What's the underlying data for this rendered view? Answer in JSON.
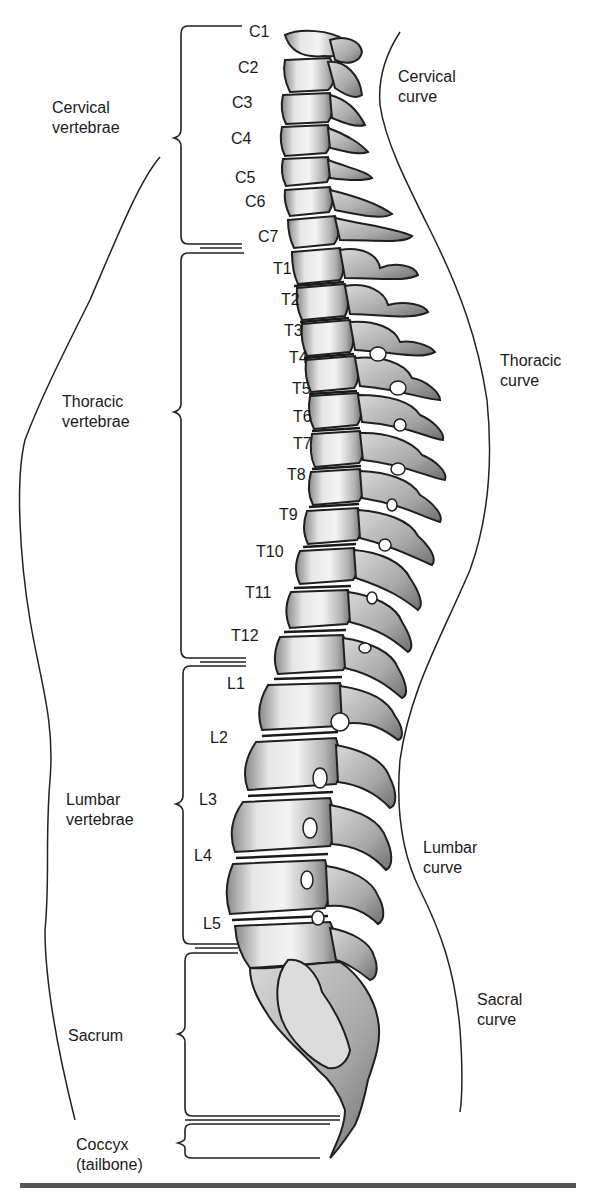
{
  "diagram": {
    "groups": [
      {
        "id": "cervical",
        "line1": "Cervical",
        "line2": "vertebrae"
      },
      {
        "id": "thoracic",
        "line1": "Thoracic",
        "line2": "vertebrae"
      },
      {
        "id": "lumbar",
        "line1": "Lumbar",
        "line2": "vertebrae"
      },
      {
        "id": "sacrum",
        "line1": "Sacrum",
        "line2": ""
      },
      {
        "id": "coccyx",
        "line1": "Coccyx",
        "line2": "(tailbone)"
      }
    ],
    "curves": [
      {
        "id": "cervical",
        "line1": "Cervical",
        "line2": "curve"
      },
      {
        "id": "thoracic",
        "line1": "Thoracic",
        "line2": "curve"
      },
      {
        "id": "lumbar",
        "line1": "Lumbar",
        "line2": "curve"
      },
      {
        "id": "sacral",
        "line1": "Sacral",
        "line2": "curve"
      }
    ],
    "vertebrae": {
      "cervical": [
        "C1",
        "C2",
        "C3",
        "C4",
        "C5",
        "C6",
        "C7"
      ],
      "thoracic": [
        "T1",
        "T2",
        "T3",
        "T4",
        "T5",
        "T6",
        "T7",
        "T8",
        "T9",
        "T10",
        "T11",
        "T12"
      ],
      "lumbar": [
        "L1",
        "L2",
        "L3",
        "L4",
        "L5"
      ]
    }
  }
}
